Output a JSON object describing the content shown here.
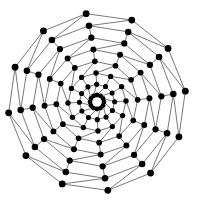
{
  "graph": {
    "type": "spiral-radial-mesh",
    "center": [
      97,
      102
    ],
    "spokes": 12,
    "rings": 8,
    "inner_radius": 7,
    "outer_radius": 89,
    "twist_per_ring_deg": 14,
    "node_radius_inner": 2.4,
    "node_radius_outer": 3.4,
    "node_color": "#000000",
    "edge_color": "#555555"
  }
}
